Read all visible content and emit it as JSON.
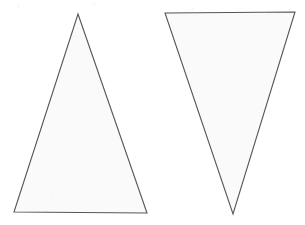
{
  "figure": {
    "width": 305,
    "height": 225,
    "background_color": "#ffffff",
    "shapes": [
      {
        "name": "left-triangle",
        "orientation": "pointing-up",
        "points": "78,14 147,213 14,212",
        "fill_color": "#fafafa",
        "stroke_color": "#565656",
        "stroke_width": 1.1
      },
      {
        "name": "right-triangle",
        "orientation": "pointing-down",
        "points": "165,13 295,12 233,214",
        "fill_color": "#fafafa",
        "stroke_color": "#565656",
        "stroke_width": 1.1
      }
    ]
  }
}
